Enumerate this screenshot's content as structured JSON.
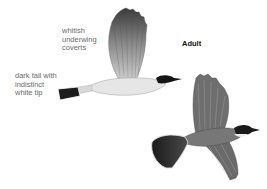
{
  "annotations": {
    "coverts": "whitish\nunderwing\ncoverts",
    "tail": "dark tail with\nindistinct\nwhite tip"
  },
  "title": "Adult",
  "figures": [
    {
      "name": "kingbird-side-view",
      "pose": "flying, wing raised, side view"
    },
    {
      "name": "kingbird-top-view",
      "pose": "flying, dorsal view, wings spread"
    }
  ],
  "colors": {
    "tail": "#1c1c1c",
    "head": "#151515",
    "wing": "#7a7a7a",
    "body_light": "#e4e4e4",
    "label": "#6a6a6a"
  }
}
